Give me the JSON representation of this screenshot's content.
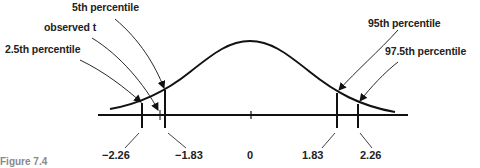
{
  "figure": {
    "type": "t-distribution",
    "labels": {
      "p5": "5th percentile",
      "observed": "observed t",
      "p2_5": "2.5th percentile",
      "p95": "95th percentile",
      "p97_5": "97.5th percentile"
    },
    "ticks": {
      "neg226": "−2.26",
      "neg183": "−1.83",
      "zero": "0",
      "pos183": "1.83",
      "pos226": "2.26"
    },
    "caption": "Figure 7.4"
  }
}
